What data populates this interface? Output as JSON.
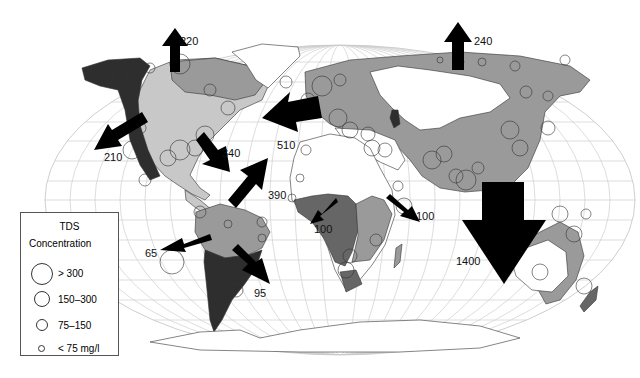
{
  "map": {
    "title": "Riverine TDS flux to oceans",
    "land_colors": {
      "high": "#2e2e2e",
      "medium": "#666666",
      "low": "#9a9a9a",
      "very_low": "#c8c8c8",
      "arid": "#ffffff"
    },
    "arrow_color": "#000000",
    "flux_arrows": [
      {
        "id": "arctic-north-america",
        "label": "220",
        "direction": "north"
      },
      {
        "id": "arctic-eurasia",
        "label": "240",
        "direction": "north"
      },
      {
        "id": "pacific-north-america",
        "label": "210",
        "direction": "southwest"
      },
      {
        "id": "gulf-of-mexico",
        "label": "340",
        "direction": "southeast"
      },
      {
        "id": "atlantic-south-america",
        "label": "390",
        "direction": "northeast"
      },
      {
        "id": "atlantic-europe",
        "label": "510",
        "direction": "west"
      },
      {
        "id": "atlantic-africa",
        "label": "100",
        "direction": "southwest"
      },
      {
        "id": "indian-africa",
        "label": "100",
        "direction": "southeast"
      },
      {
        "id": "pacific-south-america",
        "label": "65",
        "direction": "west"
      },
      {
        "id": "atlantic-south-south-america",
        "label": "95",
        "direction": "southeast"
      },
      {
        "id": "indo-pacific-asia",
        "label": "1400",
        "direction": "south"
      }
    ]
  },
  "legend": {
    "title_line1": "TDS",
    "title_line2": "Concentration",
    "items": [
      {
        "label": "> 300",
        "size": "large"
      },
      {
        "label": "150–300",
        "size": "medium"
      },
      {
        "label": "75–150",
        "size": "small"
      },
      {
        "label": "< 75 mg/l",
        "size": "tiny"
      }
    ]
  }
}
